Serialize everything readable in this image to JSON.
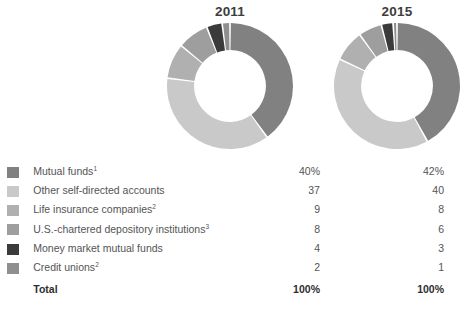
{
  "figure": {
    "background": "#ffffff",
    "text_color": "#545454"
  },
  "charts": [
    {
      "id": "donut-2011",
      "title": "2011"
    },
    {
      "id": "donut-2015",
      "title": "2015"
    }
  ],
  "legend": {
    "rows": [
      {
        "label": "Mutual funds",
        "footnote": "1",
        "color": "#818181",
        "value_2011": "40%",
        "value_2015": "42%"
      },
      {
        "label": "Other self-directed accounts",
        "footnote": "",
        "color": "#c9c9c9",
        "value_2011": "37",
        "value_2015": "40"
      },
      {
        "label": "Life insurance companies",
        "footnote": "2",
        "color": "#b0b0b0",
        "value_2011": "9",
        "value_2015": "8"
      },
      {
        "label": "U.S.-chartered depository institutions",
        "footnote": "3",
        "color": "#9e9e9e",
        "value_2011": "8",
        "value_2015": "6"
      },
      {
        "label": "Money market mutual funds",
        "footnote": "",
        "color": "#3b3b3b",
        "value_2011": "4",
        "value_2015": "3"
      },
      {
        "label": "Credit unions",
        "footnote": "2",
        "color": "#8f8f8f",
        "value_2011": "2",
        "value_2015": "1"
      }
    ],
    "total": {
      "label": "Total",
      "value_2011": "100%",
      "value_2015": "100%"
    }
  },
  "chart_data": [
    {
      "type": "pie",
      "variant": "donut",
      "title": "2011",
      "unit": "percent",
      "start_angle_deg": 0,
      "direction": "clockwise",
      "inner_radius_ratio": 0.57,
      "categories": [
        "Mutual funds",
        "Other self-directed accounts",
        "Life insurance companies",
        "U.S.-chartered depository institutions",
        "Money market mutual funds",
        "Credit unions"
      ],
      "values": [
        40,
        37,
        9,
        8,
        4,
        2
      ],
      "colors": [
        "#818181",
        "#c9c9c9",
        "#b0b0b0",
        "#9e9e9e",
        "#3b3b3b",
        "#8f8f8f"
      ],
      "total": 100,
      "legend_position": "below"
    },
    {
      "type": "pie",
      "variant": "donut",
      "title": "2015",
      "unit": "percent",
      "start_angle_deg": 0,
      "direction": "clockwise",
      "inner_radius_ratio": 0.57,
      "categories": [
        "Mutual funds",
        "Other self-directed accounts",
        "Life insurance companies",
        "U.S.-chartered depository institutions",
        "Money market mutual funds",
        "Credit unions"
      ],
      "values": [
        42,
        40,
        8,
        6,
        3,
        1
      ],
      "colors": [
        "#818181",
        "#c9c9c9",
        "#b0b0b0",
        "#9e9e9e",
        "#3b3b3b",
        "#8f8f8f"
      ],
      "total": 100,
      "legend_position": "below"
    }
  ]
}
